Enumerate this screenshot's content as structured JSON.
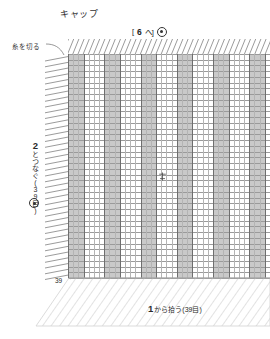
{
  "document": {
    "title": "キャップ",
    "type": "knitting-chart"
  },
  "annotations": {
    "cut_yarn": "糸を切る",
    "top_marker_bracket_open": "[",
    "top_marker_number": "6",
    "top_marker_suffix": "へ]",
    "top_marker_symbol": "ring-dot",
    "left_caption_number": "2",
    "left_caption_text": "とつなぐ(39目)",
    "left_caption_symbol": "ring-dot",
    "bottom_number": "1",
    "bottom_text": "から拾う(39目)",
    "row_count_label": "39"
  },
  "colors": {
    "band_fill": "#c9c9c9",
    "grid_line": "#9a9a9a",
    "column_line": "#6e6e6e",
    "hatch": "#cfcfcf",
    "ink": "#2b2b2b"
  },
  "chart_data": {
    "type": "table",
    "title": "キャップ",
    "xlabel": "",
    "ylabel": "",
    "stitch_columns": 39,
    "rows": 39,
    "cell_width": 5.2,
    "cell_height": 5.75,
    "band_pattern": {
      "period_columns": 7,
      "shaded_columns": 3,
      "first_shaded_index": 0
    },
    "grid": true,
    "legend": [],
    "notes": [
      "糸を切る",
      "[6へ] ⊙",
      "2とつなぐ(39目) ⊙",
      "1から拾う(39目)",
      "39"
    ]
  }
}
